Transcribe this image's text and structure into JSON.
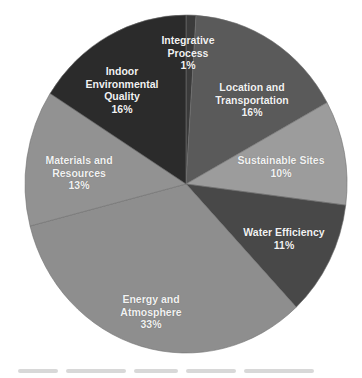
{
  "chart_data": {
    "type": "pie",
    "title": "",
    "start_angle_deg": 0,
    "direction": "clockwise",
    "slices": [
      {
        "label": "Integrative Process",
        "value": 1,
        "display": "1%",
        "color": "#3b3b3b"
      },
      {
        "label": "Location and Transportation",
        "value": 16,
        "display": "16%",
        "color": "#5a5a5a"
      },
      {
        "label": "Sustainable Sites",
        "value": 10,
        "display": "10%",
        "color": "#9c9c9c"
      },
      {
        "label": "Water Efficiency",
        "value": 11,
        "display": "11%",
        "color": "#484848"
      },
      {
        "label": "Energy and Atmosphere",
        "value": 33,
        "display": "33%",
        "color": "#8e8e8e"
      },
      {
        "label": "Materials and Resources",
        "value": 13,
        "display": "13%",
        "color": "#929292"
      },
      {
        "label": "Indoor Environmental Quality",
        "value": 16,
        "display": "16%",
        "color": "#2b2b2b"
      }
    ],
    "categories": [
      "Integrative Process",
      "Location and Transportation",
      "Sustainable Sites",
      "Water Efficiency",
      "Energy and Atmosphere",
      "Materials and Resources",
      "Indoor Environmental Quality"
    ],
    "values": [
      1,
      16,
      10,
      11,
      33,
      13,
      16
    ],
    "legend": "none (data labels inside slices)"
  },
  "labels": {
    "ip": {
      "line1": "Integrative",
      "line2": "Process",
      "pct": "1%"
    },
    "lt": {
      "line1": "Location and",
      "line2": "Transportation",
      "pct": "16%"
    },
    "ss": {
      "line1": "Sustainable Sites",
      "pct": "10%"
    },
    "we": {
      "line1": "Water Efficiency",
      "pct": "11%"
    },
    "ea": {
      "line1": "Energy and",
      "line2": "Atmosphere",
      "pct": "33%"
    },
    "mr": {
      "line1": "Materials and",
      "line2": "Resources",
      "pct": "13%"
    },
    "ieq": {
      "line1": "Indoor",
      "line2": "Environmental",
      "line3": "Quality",
      "pct": "16%"
    }
  }
}
